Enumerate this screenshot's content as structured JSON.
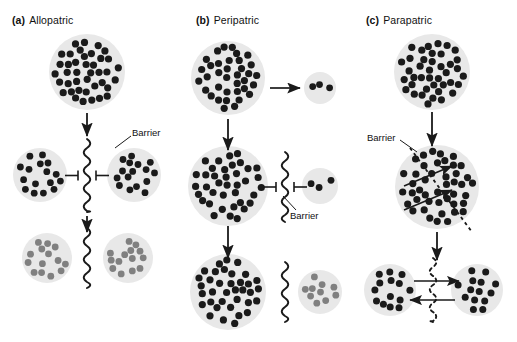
{
  "figure": {
    "background_color": "#ffffff",
    "circle_fill": "#e8e8e8",
    "dot_dark_color": "#1a1a1a",
    "dot_gray_color": "#808080",
    "line_color": "#1a1a1a",
    "width": 517,
    "height": 342
  },
  "panels": [
    {
      "id": "a",
      "tag": "(a)",
      "name": "Allopatric",
      "barrier_labels": [
        "Barrier"
      ]
    },
    {
      "id": "b",
      "tag": "(b)",
      "name": "Peripatric",
      "barrier_labels": [
        "Barrier"
      ]
    },
    {
      "id": "c",
      "tag": "(c)",
      "name": "Parapatric",
      "barrier_labels": [
        "Barrier"
      ]
    }
  ],
  "labels": {
    "barrier": "Barrier"
  },
  "chart_data": {
    "type": "diagram",
    "panels": [
      {
        "id": "a",
        "label": "(a) Allopatric",
        "stages": [
          {
            "stage": 1,
            "description": "Single large ancestral population",
            "populations": [
              {
                "cx": 87,
                "cy": 72,
                "r": 38,
                "dot_count": 40,
                "dot_color": "dark",
                "dot_r": 3.6
              }
            ]
          },
          {
            "stage": 2,
            "description": "Geographic barrier splits population; gene flow blocked",
            "populations": [
              {
                "cx": 40,
                "cy": 175,
                "r": 27,
                "dot_count": 16,
                "dot_color": "dark",
                "dot_r": 3.4
              },
              {
                "cx": 134,
                "cy": 175,
                "r": 27,
                "dot_count": 16,
                "dot_color": "dark",
                "dot_r": 3.4
              }
            ],
            "barrier": {
              "type": "wavy-solid",
              "x": 87,
              "y_top": 139,
              "y_bottom": 212
            },
            "blocked_arrows": 2
          },
          {
            "stage": 3,
            "description": "Divergence of both isolated populations",
            "populations": [
              {
                "cx": 47,
                "cy": 258,
                "r": 25,
                "dot_count": 14,
                "dot_color": "gray",
                "dot_r": 3.4
              },
              {
                "cx": 128,
                "cy": 258,
                "r": 25,
                "dot_count": 14,
                "dot_color": "gray",
                "dot_r": 3.4
              }
            ],
            "barrier": {
              "type": "wavy-solid",
              "x": 87,
              "y_top": 228,
              "y_bottom": 288
            }
          }
        ]
      },
      {
        "id": "b",
        "label": "(b) Peripatric",
        "stages": [
          {
            "stage": 1,
            "description": "Large ancestral population founds a small peripheral isolate",
            "populations": [
              {
                "cx": 228,
                "cy": 78,
                "r": 37,
                "dot_count": 36,
                "dot_color": "dark",
                "dot_r": 3.6
              },
              {
                "cx": 320,
                "cy": 88,
                "r": 16,
                "dot_count": 3,
                "dot_color": "dark",
                "dot_r": 3.4
              }
            ],
            "arrow": {
              "from_x": 270,
              "to_x": 300,
              "y": 88,
              "direction": "right"
            }
          },
          {
            "stage": 2,
            "description": "Barrier blocks gene flow between main population and isolate",
            "populations": [
              {
                "cx": 228,
                "cy": 186,
                "r": 40,
                "dot_count": 38,
                "dot_color": "dark",
                "dot_r": 3.6
              },
              {
                "cx": 320,
                "cy": 186,
                "r": 18,
                "dot_count": 3,
                "dot_color": "dark",
                "dot_r": 3.4
              }
            ],
            "barrier": {
              "type": "wavy-solid",
              "x": 285,
              "y_top": 152,
              "y_bottom": 222
            },
            "blocked_arrows": 2
          },
          {
            "stage": 3,
            "description": "Small isolate diverges into new species",
            "populations": [
              {
                "cx": 228,
                "cy": 292,
                "r": 38,
                "dot_count": 36,
                "dot_color": "dark",
                "dot_r": 3.6
              },
              {
                "cx": 320,
                "cy": 292,
                "r": 22,
                "dot_count": 10,
                "dot_color": "gray",
                "dot_r": 3.4
              }
            ],
            "barrier": {
              "type": "wavy-solid",
              "x": 285,
              "y_top": 262,
              "y_bottom": 322
            }
          }
        ]
      },
      {
        "id": "c",
        "label": "(c) Parapatric",
        "stages": [
          {
            "stage": 1,
            "description": "Single continuous ancestral population",
            "populations": [
              {
                "cx": 432,
                "cy": 72,
                "r": 38,
                "dot_count": 40,
                "dot_color": "dark",
                "dot_r": 3.6
              }
            ]
          },
          {
            "stage": 2,
            "description": "Partial barrier within continuous range; some gene flow persists",
            "populations": [
              {
                "cx": 437,
                "cy": 187,
                "r": 42,
                "dot_count": 44,
                "dot_color": "dark",
                "dot_r": 3.6
              }
            ],
            "barrier": {
              "type": "dashed-diagonal",
              "x1": 410,
              "y1": 148,
              "x2": 472,
              "y2": 232
            },
            "crossing_arrows": 2
          },
          {
            "stage": 3,
            "description": "Adjacent populations diverge while still exchanging migrants",
            "populations": [
              {
                "cx": 390,
                "cy": 290,
                "r": 26,
                "dot_count": 14,
                "dot_color": "dark",
                "dot_r": 3.5
              },
              {
                "cx": 477,
                "cy": 290,
                "r": 26,
                "dot_count": 14,
                "dot_color": "dark",
                "dot_r": 3.5
              }
            ],
            "barrier": {
              "type": "dashed-wavy",
              "x": 433,
              "y_top": 258,
              "y_bottom": 322
            },
            "crossing_arrows": 2
          }
        ]
      }
    ]
  }
}
